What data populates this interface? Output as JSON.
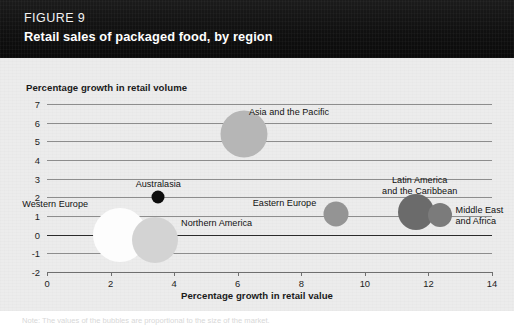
{
  "header": {
    "figure_number": "FIGURE 9",
    "title": "Retail sales of packaged food, by region",
    "background_color": "#141414",
    "text_color": "#ffffff"
  },
  "panel": {
    "background_color": "#ececec"
  },
  "footnote": {
    "text": "Note: The values of the bubbles are proportional to the size of the market."
  },
  "chart_data": {
    "type": "scatter",
    "title": "Retail sales of packaged food, by region",
    "xlabel": "Percentage growth in retail value",
    "ylabel": "Percentage growth in retail volume",
    "xlim": [
      0,
      14
    ],
    "ylim": [
      -2,
      7
    ],
    "xticks": [
      "0",
      "2",
      "4",
      "6",
      "8",
      "10",
      "12",
      "14"
    ],
    "yticks": [
      "7",
      "6",
      "5",
      "4",
      "3",
      "2",
      "1",
      "0",
      "-1",
      "-2"
    ],
    "grid": "horizontal",
    "legend": "none",
    "zero_line_emphasised": true,
    "points": [
      {
        "label": "Western Europe",
        "x": 2.3,
        "y": 0.0,
        "size_px": 54,
        "color": "#fdfdfd",
        "label_pos": "left",
        "label_dx": -32,
        "label_dy": -36
      },
      {
        "label": "Northern America",
        "x": 3.4,
        "y": -0.3,
        "size_px": 46,
        "color": "#d3d3d3",
        "label_pos": "right",
        "label_dx": 26,
        "label_dy": -22
      },
      {
        "label": "Australasia",
        "x": 3.5,
        "y": 2.0,
        "size_px": 13,
        "color": "#0d0d0d",
        "label_pos": "center",
        "label_dx": 0,
        "label_dy": -18
      },
      {
        "label": "Asia and the Pacific",
        "x": 6.2,
        "y": 5.4,
        "size_px": 47,
        "color": "#b6b6b6",
        "label_pos": "center",
        "label_dx": 45,
        "label_dy": -27
      },
      {
        "label": "Eastern Europe",
        "x": 9.1,
        "y": 1.1,
        "size_px": 25,
        "color": "#949494",
        "label_pos": "left",
        "label_dx": -20,
        "label_dy": -16
      },
      {
        "label": "Latin America\nand the Caribbean",
        "x": 11.6,
        "y": 1.2,
        "size_px": 36,
        "color": "#6b6b6b",
        "label_pos": "center",
        "label_dx": 4,
        "label_dy": -37
      },
      {
        "label": "Middle East\nand Africa",
        "x": 12.35,
        "y": 1.05,
        "size_px": 24,
        "color": "#7b7b7b",
        "label_pos": "right",
        "label_dx": 16,
        "label_dy": -10
      }
    ]
  }
}
